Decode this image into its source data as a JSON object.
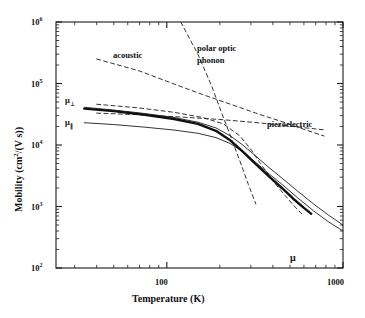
{
  "chart_data": {
    "type": "line",
    "title": "",
    "xlabel": "Temperature (K)",
    "ylabel": "Mobility (cm2/(V s))",
    "ylabel_display": "Mobility (cm²/(V s))",
    "xscale": "log",
    "yscale": "log",
    "xlim": [
      23.5,
      1000
    ],
    "ylim": [
      100,
      1000000
    ],
    "xticks_major": [
      100,
      1000
    ],
    "xticklabels": [
      "100",
      "1000"
    ],
    "yticks_major": [
      100,
      1000,
      10000,
      100000,
      1000000
    ],
    "yticklabels": [
      "10²",
      "10³",
      "10⁴",
      "10⁵",
      "10⁶"
    ],
    "grid": false,
    "legend": "none (inline curve annotations)",
    "annotations": [
      {
        "text": "acoustic",
        "x": 68,
        "y": 230000
      },
      {
        "text": "polar optic",
        "x": 200,
        "y": 300000
      },
      {
        "text": "phonon",
        "x": 200,
        "y": 180000
      },
      {
        "text": "piezoelectric",
        "x": 440,
        "y": 21000
      },
      {
        "text": "μ⊥",
        "x": 31,
        "y": 43000
      },
      {
        "text": "μ∥",
        "x": 31,
        "y": 23000
      },
      {
        "text": "μ",
        "x": 430,
        "y": 300
      }
    ],
    "series": [
      {
        "name": "acoustic",
        "style": "dashed",
        "points": [
          [
            40,
            250000
          ],
          [
            70,
            160000
          ],
          [
            110,
            98000
          ],
          [
            160,
            66000
          ],
          [
            230,
            46000
          ],
          [
            320,
            33000
          ],
          [
            450,
            24000
          ],
          [
            600,
            18000
          ],
          [
            780,
            14000
          ]
        ]
      },
      {
        "name": "polar optic phonon",
        "style": "dashed",
        "points": [
          [
            120,
            1000000
          ],
          [
            150,
            300000
          ],
          [
            180,
            90000
          ],
          [
            205,
            33000
          ],
          [
            230,
            14000
          ],
          [
            260,
            5500
          ],
          [
            290,
            2300
          ],
          [
            320,
            1100
          ]
        ]
      },
      {
        "name": "piezoelectric",
        "style": "dashed",
        "points": [
          [
            40,
            33000
          ],
          [
            70,
            31000
          ],
          [
            120,
            28500
          ],
          [
            200,
            26000
          ],
          [
            330,
            23000
          ],
          [
            520,
            20000
          ],
          [
            800,
            17500
          ]
        ]
      },
      {
        "name": "mu-perp-dashed",
        "style": "dashed",
        "points": [
          [
            40,
            46000
          ],
          [
            70,
            40000
          ],
          [
            110,
            34000
          ],
          [
            160,
            28000
          ],
          [
            210,
            22000
          ],
          [
            260,
            14000
          ],
          [
            300,
            8500
          ],
          [
            340,
            5000
          ],
          [
            400,
            2600
          ],
          [
            470,
            1500
          ],
          [
            540,
            950
          ],
          [
            600,
            700
          ]
        ]
      },
      {
        "name": "mu-perpendicular",
        "style": "solid-thin",
        "points": [
          [
            34,
            41000
          ],
          [
            50,
            37000
          ],
          [
            75,
            32500
          ],
          [
            110,
            28000
          ],
          [
            150,
            23500
          ],
          [
            190,
            19000
          ],
          [
            230,
            14000
          ],
          [
            270,
            10000
          ],
          [
            320,
            6600
          ],
          [
            380,
            4300
          ],
          [
            450,
            2900
          ],
          [
            550,
            1800
          ],
          [
            680,
            1100
          ],
          [
            830,
            720
          ],
          [
            1000,
            500
          ]
        ]
      },
      {
        "name": "mu-parallel",
        "style": "solid-thin",
        "points": [
          [
            34,
            23000
          ],
          [
            50,
            21500
          ],
          [
            75,
            19500
          ],
          [
            110,
            17500
          ],
          [
            150,
            15500
          ],
          [
            190,
            13200
          ],
          [
            230,
            10500
          ],
          [
            270,
            7800
          ],
          [
            320,
            5200
          ],
          [
            380,
            3400
          ],
          [
            450,
            2300
          ],
          [
            550,
            1400
          ],
          [
            680,
            850
          ],
          [
            830,
            560
          ],
          [
            1000,
            400
          ]
        ]
      },
      {
        "name": "mu",
        "style": "solid-bold",
        "points": [
          [
            34,
            39000
          ],
          [
            50,
            35500
          ],
          [
            75,
            31000
          ],
          [
            110,
            26500
          ],
          [
            150,
            22000
          ],
          [
            190,
            17000
          ],
          [
            230,
            11800
          ],
          [
            270,
            7800
          ],
          [
            320,
            4900
          ],
          [
            380,
            3100
          ],
          [
            450,
            2000
          ],
          [
            520,
            1350
          ],
          [
            600,
            950
          ],
          [
            660,
            760
          ]
        ]
      }
    ]
  },
  "axis": {
    "x_title": "Temperature (K)",
    "y_title_parts": {
      "pre": "Mobility (cm",
      "sup": "2",
      "mid": "/(V s))"
    },
    "x_labels": [
      "100",
      "1000"
    ],
    "y_labels": [
      {
        "base": "10",
        "exp": "6"
      },
      {
        "base": "10",
        "exp": "5"
      },
      {
        "base": "10",
        "exp": "4"
      },
      {
        "base": "10",
        "exp": "3"
      },
      {
        "base": "10",
        "exp": "2"
      }
    ]
  },
  "curve_labels": {
    "acoustic": "acoustic",
    "polar_optic": "polar optic",
    "phonon": "phonon",
    "piezoelectric": "piezoelectric",
    "mu_perp_base": "μ",
    "mu_perp_sub": "⊥",
    "mu_par_base": "μ",
    "mu_par_sub": "∥",
    "mu": "μ"
  },
  "colors": {
    "line": "#000000",
    "background": "#ffffff",
    "text": "#111111"
  }
}
